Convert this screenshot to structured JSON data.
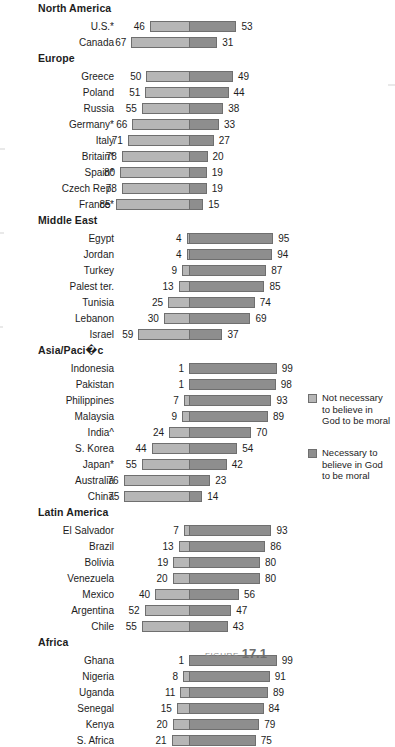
{
  "chart_data": {
    "type": "bar",
    "subtype": "diverging-stacked-bar",
    "title": "",
    "xlabel": "",
    "ylabel": "",
    "xlim": [
      -100,
      100
    ],
    "grid": false,
    "legend_position": "right",
    "value_unit": "percent",
    "series": [
      {
        "name": "Not necessary to believe in God to be moral",
        "color": "#b6b6b6",
        "side": "left"
      },
      {
        "name": "Necessary to believe in God to be moral",
        "color": "#8e8e8e",
        "side": "right"
      }
    ],
    "groups": [
      {
        "label": "North America",
        "rows": [
          {
            "category": "U.S.*",
            "left": 46,
            "right": 53
          },
          {
            "category": "Canada",
            "left": 67,
            "right": 31
          }
        ]
      },
      {
        "label": "Europe",
        "rows": [
          {
            "category": "Greece",
            "left": 50,
            "right": 49
          },
          {
            "category": "Poland",
            "left": 51,
            "right": 44
          },
          {
            "category": "Russia",
            "left": 55,
            "right": 38
          },
          {
            "category": "Germany*",
            "left": 66,
            "right": 33
          },
          {
            "category": "Italy",
            "left": 71,
            "right": 27
          },
          {
            "category": "Britain*",
            "left": 78,
            "right": 20
          },
          {
            "category": "Spain*",
            "left": 80,
            "right": 19
          },
          {
            "category": "Czech Rep.",
            "left": 78,
            "right": 19
          },
          {
            "category": "France*",
            "left": 85,
            "right": 15
          }
        ]
      },
      {
        "label": "Middle East",
        "rows": [
          {
            "category": "Egypt",
            "left": 4,
            "right": 95
          },
          {
            "category": "Jordan",
            "left": 4,
            "right": 94
          },
          {
            "category": "Turkey",
            "left": 9,
            "right": 87
          },
          {
            "category": "Palest ter.",
            "left": 13,
            "right": 85
          },
          {
            "category": "Tunisia",
            "left": 25,
            "right": 74
          },
          {
            "category": "Lebanon",
            "left": 30,
            "right": 69
          },
          {
            "category": "Israel",
            "left": 59,
            "right": 37
          }
        ]
      },
      {
        "label": "Asia/Paci�c",
        "rows": [
          {
            "category": "Indonesia",
            "left": 1,
            "right": 99
          },
          {
            "category": "Pakistan",
            "left": 1,
            "right": 98
          },
          {
            "category": "Philippines",
            "left": 7,
            "right": 93
          },
          {
            "category": "Malaysia",
            "left": 9,
            "right": 89
          },
          {
            "category": "India^",
            "left": 24,
            "right": 70
          },
          {
            "category": "S. Korea",
            "left": 44,
            "right": 54
          },
          {
            "category": "Japan*",
            "left": 55,
            "right": 42
          },
          {
            "category": "Australia",
            "left": 76,
            "right": 23
          },
          {
            "category": "China",
            "left": 75,
            "right": 14
          }
        ]
      },
      {
        "label": "Latin America",
        "rows": [
          {
            "category": "El Salvador",
            "left": 7,
            "right": 93
          },
          {
            "category": "Brazil",
            "left": 13,
            "right": 86
          },
          {
            "category": "Bolivia",
            "left": 19,
            "right": 80
          },
          {
            "category": "Venezuela",
            "left": 20,
            "right": 80
          },
          {
            "category": "Mexico",
            "left": 40,
            "right": 56
          },
          {
            "category": "Argentina",
            "left": 52,
            "right": 47
          },
          {
            "category": "Chile",
            "left": 55,
            "right": 43
          }
        ]
      },
      {
        "label": "Africa",
        "rows": [
          {
            "category": "Ghana",
            "left": 1,
            "right": 99
          },
          {
            "category": "Nigeria",
            "left": 8,
            "right": 91
          },
          {
            "category": "Uganda",
            "left": 11,
            "right": 89
          },
          {
            "category": "Senegal",
            "left": 15,
            "right": 84
          },
          {
            "category": "Kenya",
            "left": 20,
            "right": 79
          },
          {
            "category": "S. Africa",
            "left": 21,
            "right": 75
          }
        ]
      }
    ]
  },
  "legend": {
    "items": [
      {
        "swatch": "light",
        "label": "Not necessary to believe in God to be moral"
      },
      {
        "swatch": "dark",
        "label": "Necessary to believe in God to be moral"
      }
    ]
  },
  "caption": {
    "prefix": "FIGURE",
    "number": "17.1"
  },
  "colors": {
    "segment_left": "#b6b6b6",
    "segment_right": "#8e8e8e",
    "outline": "#6f6f6f",
    "text": "#1d1d1d",
    "background": "#ffffff"
  }
}
